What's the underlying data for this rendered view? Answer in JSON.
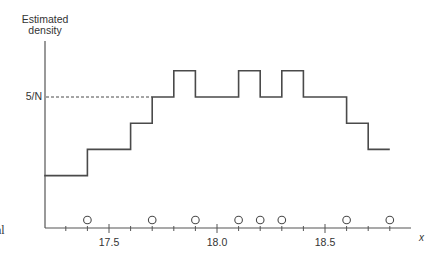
{
  "chart_data": {
    "type": "line",
    "subtype": "step-histogram",
    "title": "",
    "ylabel_lines": [
      "Estimated",
      "density"
    ],
    "xlabel": "x",
    "ytick_labels": [
      {
        "label": "5/N",
        "value": 5
      }
    ],
    "reference_line": {
      "value": 5,
      "style": "dashed",
      "from_x": 17.2,
      "to_x": 17.7
    },
    "xlim": [
      17.2,
      18.9
    ],
    "ylim": [
      0,
      7.2
    ],
    "xtick_major": [
      17.5,
      18.0,
      18.5
    ],
    "xtick_labels": [
      "17.5",
      "18.0",
      "18.5"
    ],
    "xtick_minor": [
      17.3,
      17.4,
      17.6,
      17.7,
      17.8,
      17.9,
      18.1,
      18.2,
      18.3,
      18.4,
      18.6,
      18.7,
      18.8
    ],
    "steps": [
      {
        "x0": 17.2,
        "x1": 17.4,
        "y": 2
      },
      {
        "x0": 17.4,
        "x1": 17.6,
        "y": 3
      },
      {
        "x0": 17.6,
        "x1": 17.7,
        "y": 4
      },
      {
        "x0": 17.7,
        "x1": 17.8,
        "y": 5
      },
      {
        "x0": 17.8,
        "x1": 17.9,
        "y": 6
      },
      {
        "x0": 17.9,
        "x1": 18.1,
        "y": 5
      },
      {
        "x0": 18.1,
        "x1": 18.2,
        "y": 6
      },
      {
        "x0": 18.2,
        "x1": 18.3,
        "y": 5
      },
      {
        "x0": 18.3,
        "x1": 18.4,
        "y": 6
      },
      {
        "x0": 18.4,
        "x1": 18.6,
        "y": 5
      },
      {
        "x0": 18.6,
        "x1": 18.7,
        "y": 4
      },
      {
        "x0": 18.7,
        "x1": 18.8,
        "y": 3
      }
    ],
    "y_units": "multiples of 1/N",
    "data_points": [
      17.4,
      17.7,
      17.9,
      18.1,
      18.2,
      18.3,
      18.6,
      18.8
    ],
    "grid": false,
    "legend": null
  },
  "cut_text": "al",
  "colors": {
    "line": "#4a4a4a",
    "axis": "#555555",
    "text": "#333333"
  }
}
